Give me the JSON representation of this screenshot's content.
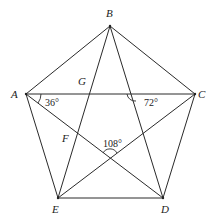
{
  "diagram": {
    "type": "geometry",
    "points": {
      "A": {
        "label": "A",
        "x": 26,
        "y": 94
      },
      "B": {
        "label": "B",
        "x": 110,
        "y": 26
      },
      "C": {
        "label": "C",
        "x": 195,
        "y": 94
      },
      "D": {
        "label": "D",
        "x": 163,
        "y": 198
      },
      "E": {
        "label": "E",
        "x": 58,
        "y": 198
      }
    },
    "intersection_labels": {
      "G": {
        "label": "G"
      },
      "F": {
        "label": "F"
      }
    },
    "segments": [
      [
        "A",
        "B"
      ],
      [
        "B",
        "C"
      ],
      [
        "C",
        "D"
      ],
      [
        "D",
        "E"
      ],
      [
        "E",
        "A"
      ],
      [
        "A",
        "C"
      ],
      [
        "A",
        "D"
      ],
      [
        "B",
        "E"
      ],
      [
        "B",
        "D"
      ],
      [
        "C",
        "E"
      ]
    ],
    "angles": {
      "angle_CAD": {
        "value": "36°"
      },
      "angle_at_AC_BD": {
        "value": "72°"
      },
      "angle_at_AD_CE": {
        "value": "108°"
      }
    }
  }
}
